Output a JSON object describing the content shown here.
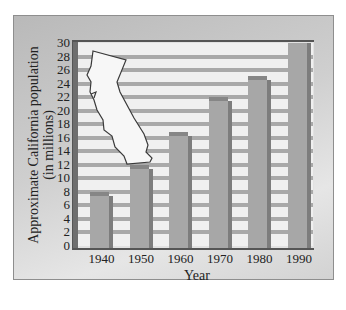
{
  "chart_data": {
    "type": "bar",
    "title": "",
    "xlabel": "Year",
    "ylabel": "Approximate California population (in millions)",
    "ylabel_lines": [
      "Approximate California population",
      "(in millions)"
    ],
    "categories": [
      "1940",
      "1950",
      "1960",
      "1970",
      "1980",
      "1990"
    ],
    "values": [
      7.4,
      11.4,
      16.3,
      21.5,
      24.5,
      30
    ],
    "ylim": [
      0,
      30
    ],
    "yticks": [
      "0",
      "2",
      "4",
      "6",
      "8",
      "10",
      "12",
      "14",
      "16",
      "18",
      "20",
      "22",
      "24",
      "26",
      "28",
      "30"
    ],
    "grid": true,
    "legend": "none",
    "annotations": [
      "Outline map of California (decorative)"
    ]
  },
  "colors": {
    "bar": "#a7a7a7",
    "bar_side": "#7d7d7d",
    "grid": "#a9a9a9",
    "plot_bg": "#f0f0f0",
    "frame": "#c8c8c8"
  }
}
